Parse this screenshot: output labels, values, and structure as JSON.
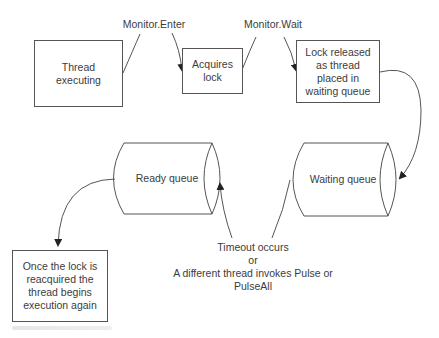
{
  "diagram": {
    "nodes": {
      "thread_executing": "Thread executing",
      "acquires_lock": "Acquires lock",
      "lock_released": "Lock released as thread placed in waiting queue",
      "ready_queue": "Ready queue",
      "waiting_queue": "Waiting queue",
      "reacquired": "Once the lock is reacquired the thread begins execution again"
    },
    "edges": {
      "monitor_enter": "Monitor.Enter",
      "monitor_wait": "Monitor.Wait",
      "timeout_line1": "Timeout occurs",
      "timeout_line2": "or",
      "timeout_line3": "A different thread invokes Pulse or",
      "timeout_line4": "PulseAll"
    },
    "colors": {
      "stroke": "#555555",
      "text": "#3c3c3c",
      "background": "#ffffff"
    }
  }
}
